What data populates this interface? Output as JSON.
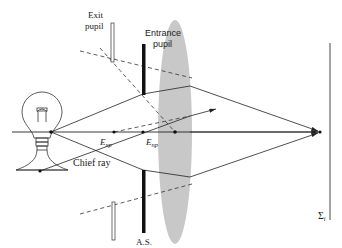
{
  "diagram": {
    "type": "optical-ray-diagram",
    "labels": {
      "exit_pupil_line1": "Exit",
      "exit_pupil_line2": "pupil",
      "entrance_pupil_line1": "Entrance",
      "entrance_pupil_line2": "pupil",
      "ezp_main": "E",
      "ezp_sub": "xp",
      "enp_main": "E",
      "enp_sub": "np",
      "chief_ray": "Chief ray",
      "aperture_stop": "A.S.",
      "image_plane_main": "Σ",
      "image_plane_sub": "i"
    },
    "elements": [
      "light-bulb-object",
      "optical-axis",
      "exit-pupil",
      "entrance-pupil-aperture-stop",
      "converging-lens",
      "image-plane",
      "marginal-rays",
      "chief-ray",
      "dashed-construction-lines"
    ],
    "colors": {
      "ink": "#222222",
      "lens_fill": "#c8c8c8",
      "stop_fill": "#111111"
    }
  }
}
